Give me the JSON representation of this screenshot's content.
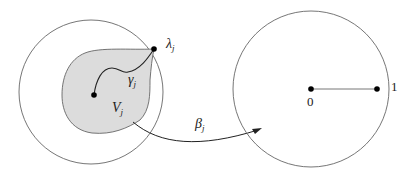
{
  "diagram": {
    "left_disk": {
      "region_label": "V",
      "region_subscript": "j",
      "curve_label": "γ",
      "curve_subscript": "j",
      "boundary_point_label": "λ",
      "boundary_point_subscript": "j",
      "region_fill": "#dcdcdc"
    },
    "map_arrow": {
      "label": "β",
      "subscript": "j"
    },
    "right_disk": {
      "center_label": "0",
      "boundary_label": "1"
    },
    "colors": {
      "stroke": "#555555",
      "dot": "#000000",
      "region_fill": "#dcdcdc"
    }
  }
}
